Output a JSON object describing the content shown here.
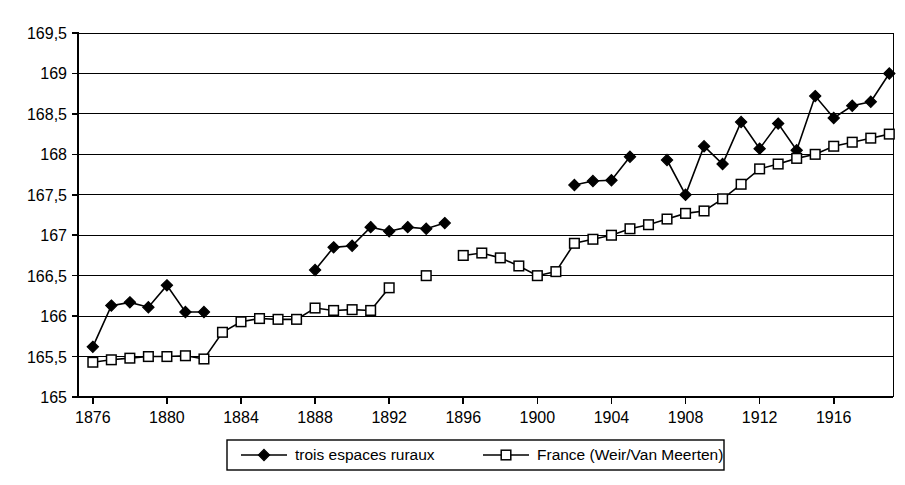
{
  "chart_data": {
    "type": "line",
    "title": "",
    "subtitle": "",
    "xlabel": "",
    "ylabel": "",
    "xlim": [
      1875.2,
      1919.2
    ],
    "ylim": [
      165,
      169.5
    ],
    "ytick_step": 0.5,
    "xtick_step": 4,
    "grid": "horizontal",
    "decimal_separator": ",",
    "legend_position": "bottom",
    "ytick_labels": [
      "165",
      "165,5",
      "166",
      "166,5",
      "167",
      "167,5",
      "168",
      "168,5",
      "169",
      "169,5"
    ],
    "ytick_values": [
      165,
      165.5,
      166,
      166.5,
      167,
      167.5,
      168,
      168.5,
      169,
      169.5
    ],
    "xtick_labels": [
      "1876",
      "1880",
      "1884",
      "1888",
      "1892",
      "1896",
      "1900",
      "1904",
      "1908",
      "1912",
      "1916"
    ],
    "xtick_values": [
      1876,
      1880,
      1884,
      1888,
      1892,
      1896,
      1900,
      1904,
      1908,
      1912,
      1916
    ],
    "series": [
      {
        "name": "trois espaces ruraux",
        "marker": "filled-diamond",
        "marker_color": "#000000",
        "line_color": "#000000",
        "segments": [
          {
            "x": [
              1876,
              1877,
              1878,
              1879,
              1880,
              1881,
              1882
            ],
            "y": [
              165.62,
              166.13,
              166.17,
              166.11,
              166.38,
              166.05,
              166.05
            ]
          },
          {
            "x": [
              1888,
              1889,
              1890,
              1891,
              1892,
              1893,
              1894,
              1895
            ],
            "y": [
              166.57,
              166.85,
              166.87,
              167.1,
              167.05,
              167.1,
              167.08,
              167.15
            ]
          },
          {
            "x": [
              1902,
              1903,
              1904,
              1905
            ],
            "y": [
              167.62,
              167.67,
              167.68,
              167.97
            ]
          },
          {
            "x": [
              1907,
              1908,
              1909,
              1910,
              1911,
              1912,
              1913,
              1914,
              1915,
              1916,
              1917,
              1918,
              1919
            ],
            "y": [
              167.93,
              167.5,
              168.1,
              167.88,
              168.4,
              168.07,
              168.38,
              168.05,
              168.72,
              168.45,
              168.6,
              168.65,
              169.0
            ]
          }
        ]
      },
      {
        "name": "France (Weir/Van Meerten)",
        "marker": "open-square",
        "marker_color": "#ffffff",
        "line_color": "#000000",
        "segments": [
          {
            "x": [
              1876,
              1877,
              1878,
              1879,
              1880,
              1881,
              1882,
              1883,
              1884,
              1885,
              1886,
              1887,
              1888,
              1889,
              1890,
              1891,
              1892
            ],
            "y": [
              165.43,
              165.46,
              165.48,
              165.5,
              165.5,
              165.51,
              165.47,
              165.8,
              165.93,
              165.97,
              165.96,
              165.96,
              166.1,
              166.07,
              166.08,
              166.07,
              166.35
            ]
          },
          {
            "x": [
              1894
            ],
            "y": [
              166.5
            ]
          },
          {
            "x": [
              1896,
              1897,
              1898,
              1899,
              1900,
              1901,
              1902,
              1903,
              1904,
              1905,
              1906,
              1907,
              1908,
              1909,
              1910,
              1911,
              1912,
              1913,
              1914,
              1915,
              1916,
              1917,
              1918,
              1919
            ],
            "y": [
              166.75,
              166.78,
              166.72,
              166.62,
              166.5,
              166.55,
              166.9,
              166.95,
              167.0,
              167.08,
              167.13,
              167.2,
              167.27,
              167.3,
              167.45,
              167.63,
              167.82,
              167.88,
              167.95,
              168.0,
              168.1,
              168.15,
              168.2,
              168.25
            ]
          }
        ]
      }
    ],
    "legend": [
      {
        "label": "trois espaces ruraux",
        "marker": "filled-diamond"
      },
      {
        "label": "France (Weir/Van Meerten)",
        "marker": "open-square"
      }
    ]
  }
}
